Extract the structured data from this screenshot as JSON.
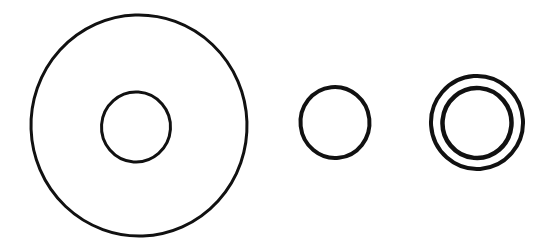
{
  "figure": {
    "canvas": {
      "width": 555,
      "height": 250
    },
    "background_color": "#ffffff",
    "stroke_color": "#111111",
    "style": "hand-inked scanned line art, no text labels, no annotations"
  },
  "shapes": [
    {
      "id": "large-washer",
      "name": "large-washer",
      "label": "Large washer with small central hole",
      "parts": [
        {
          "id": "large-washer-outer-circle",
          "name": "large-washer-outer-circle",
          "cx": 139,
          "cy": 125.5,
          "rx": 108,
          "ry": 110.5,
          "stroke_width": 3.0,
          "rotation": -2
        },
        {
          "id": "large-washer-inner-hole",
          "name": "large-washer-inner-hole",
          "cx": 136,
          "cy": 127,
          "rx": 34.5,
          "ry": 35,
          "stroke_width": 3.0,
          "rotation": 4
        }
      ]
    },
    {
      "id": "plain-ring",
      "name": "plain-ring",
      "label": "Small plain ring",
      "parts": [
        {
          "id": "plain-ring-circle",
          "name": "plain-ring-circle",
          "cx": 335,
          "cy": 122.5,
          "rx": 34.5,
          "ry": 35.5,
          "stroke_width": 4.0,
          "rotation": -6
        }
      ]
    },
    {
      "id": "double-ring",
      "name": "double-ring",
      "label": "Concentric double ring washer",
      "parts": [
        {
          "id": "double-ring-outer-circle",
          "name": "double-ring-outer-circle",
          "cx": 477,
          "cy": 122.5,
          "rx": 46,
          "ry": 46.5,
          "stroke_width": 4.0,
          "rotation": -4
        },
        {
          "id": "double-ring-inner-circle",
          "name": "double-ring-inner-circle",
          "cx": 477,
          "cy": 123,
          "rx": 34.5,
          "ry": 35,
          "stroke_width": 4.5,
          "rotation": 5
        }
      ]
    }
  ]
}
